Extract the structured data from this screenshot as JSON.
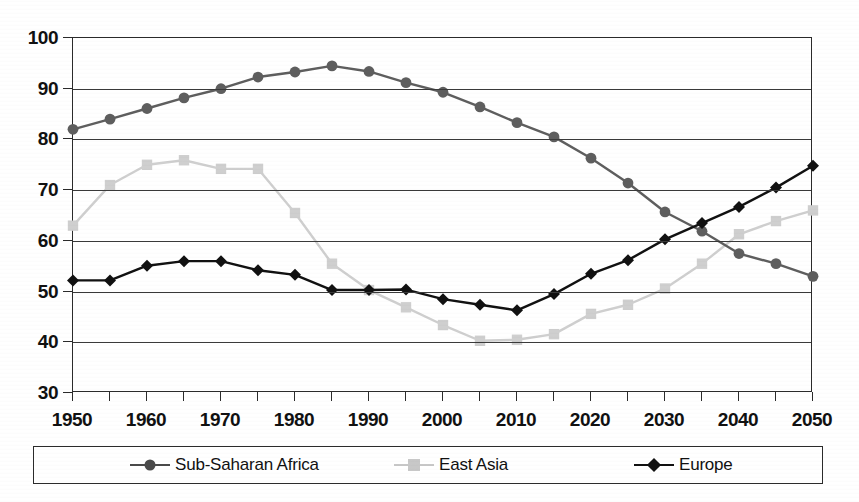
{
  "chart_data": {
    "type": "line",
    "title": "",
    "subtitle": "",
    "xlabel": "",
    "ylabel": "",
    "xlim": [
      1950,
      2050
    ],
    "ylim": [
      30,
      100
    ],
    "ytick_step": 10,
    "xtick_step": 5,
    "xlabel_step": 10,
    "grid": "horizontal",
    "legend_position": "bottom",
    "x": [
      1950,
      1955,
      1960,
      1965,
      1970,
      1975,
      1980,
      1985,
      1990,
      1995,
      2000,
      2005,
      2010,
      2015,
      2020,
      2025,
      2030,
      2035,
      2040,
      2045,
      2050
    ],
    "xtick_labels": [
      "1950",
      "1955",
      "1960",
      "1965",
      "1970",
      "1975",
      "1980",
      "1985",
      "1990",
      "1995",
      "2000",
      "2005",
      "2010",
      "2015",
      "2020",
      "2025",
      "2030",
      "2035",
      "2040",
      "2045",
      "2050"
    ],
    "xtick_labels_shown": [
      "1950",
      "1960",
      "1970",
      "1980",
      "1990",
      "2000",
      "2010",
      "2020",
      "2030",
      "2040",
      "2050"
    ],
    "ytick_labels": [
      "30",
      "40",
      "50",
      "60",
      "70",
      "80",
      "90",
      "100"
    ],
    "series": [
      {
        "name": "Sub-Saharan Africa",
        "marker": "circle",
        "color": "#5e5e5e",
        "values": [
          82.0,
          84.0,
          86.1,
          88.2,
          90.0,
          92.3,
          93.3,
          94.5,
          93.4,
          91.2,
          89.3,
          86.4,
          83.3,
          80.5,
          76.3,
          71.4,
          65.7,
          61.9,
          57.5,
          55.5,
          53.0
        ]
      },
      {
        "name": "East Asia",
        "marker": "square",
        "color": "#cfcfcf",
        "values": [
          63.0,
          71.0,
          75.0,
          75.9,
          74.2,
          74.2,
          65.5,
          55.5,
          50.3,
          46.9,
          43.4,
          40.3,
          40.5,
          41.6,
          45.6,
          47.4,
          50.6,
          55.5,
          61.3,
          63.9,
          66.0
        ]
      },
      {
        "name": "Europe",
        "marker": "diamond",
        "color": "#111111",
        "values": [
          52.2,
          52.2,
          55.1,
          56.0,
          56.0,
          54.2,
          53.3,
          50.3,
          50.3,
          50.4,
          48.5,
          47.4,
          46.3,
          49.5,
          53.5,
          56.2,
          60.3,
          63.5,
          66.7,
          70.5,
          74.8
        ]
      }
    ]
  },
  "legend": {
    "items": [
      {
        "label": "Sub-Saharan Africa",
        "marker": "circle",
        "color": "#4a4a4a"
      },
      {
        "label": "East Asia",
        "marker": "square",
        "color": "#c8c8c8"
      },
      {
        "label": "Europe",
        "marker": "diamond",
        "color": "#111111"
      }
    ]
  }
}
